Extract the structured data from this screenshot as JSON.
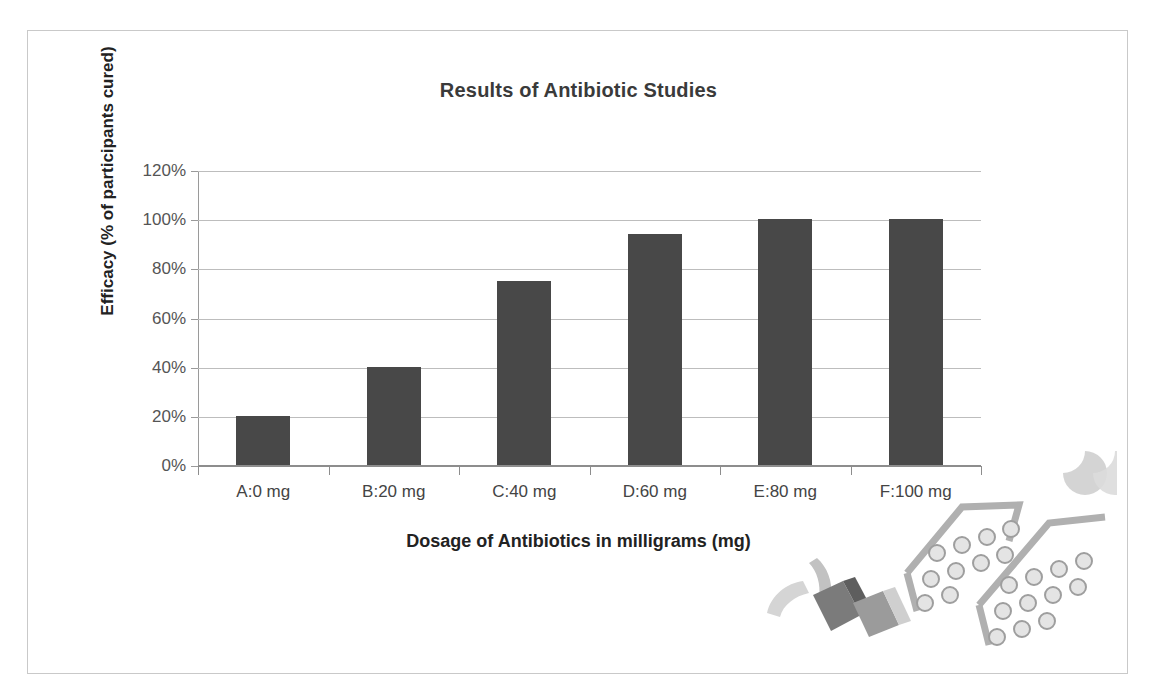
{
  "chart_data": {
    "type": "bar",
    "title": "Results of Antibiotic Studies",
    "xlabel": "Dosage of Antibiotics in milligrams (mg)",
    "ylabel": "Efficacy (% of participants cured)",
    "categories": [
      "A:0 mg",
      "B:20 mg",
      "C:40 mg",
      "D:60 mg",
      "E:80 mg",
      "F:100 mg"
    ],
    "values": [
      20,
      40,
      75,
      94,
      100,
      100
    ],
    "value_labels": [
      "20%",
      "40%",
      "75%",
      "94%",
      "100%",
      "100%"
    ],
    "ylim": [
      0,
      120
    ],
    "ytick_values": [
      0,
      20,
      40,
      60,
      80,
      100,
      120
    ],
    "ytick_labels": [
      "0%",
      "20%",
      "40%",
      "60%",
      "80%",
      "100%",
      "120%"
    ],
    "grid": true,
    "legend": null,
    "legend_position": "none",
    "bar_color": "#484848",
    "gridline_color": "#bdbdbd",
    "axis_color": "#8d8d8d",
    "title_color": "#3a3a3a",
    "tick_label_color": "#555555",
    "background_color": "#ffffff"
  },
  "figure": {
    "border_color": "#c9c9c9"
  },
  "decoration": {
    "name": "pill-blister-pack-artwork",
    "pill_fill": "#d8d8d8",
    "pill_stroke": "#a0a0a0",
    "capsule_dark": "#6e6e6e",
    "capsule_light": "#c0c0c0"
  }
}
